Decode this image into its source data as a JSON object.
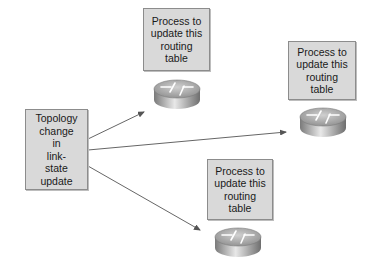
{
  "diagram": {
    "source_box": {
      "label": "Topology\nchange\nin\nlink-\nstate\nupdate"
    },
    "targets": [
      {
        "label": "Process to\nupdate this\nrouting\ntable",
        "position": "top"
      },
      {
        "label": "Process to\nupdate this\nrouting\ntable",
        "position": "right"
      },
      {
        "label": "Process to\nupdate this\nrouting\ntable",
        "position": "bottom"
      }
    ],
    "icons": [
      "router-icon",
      "router-icon",
      "router-icon"
    ],
    "colors": {
      "box_fill": "#d9d9d9",
      "box_border": "#8c8c8c",
      "arrow": "#555555",
      "router_body": "#9a9a9a"
    }
  }
}
